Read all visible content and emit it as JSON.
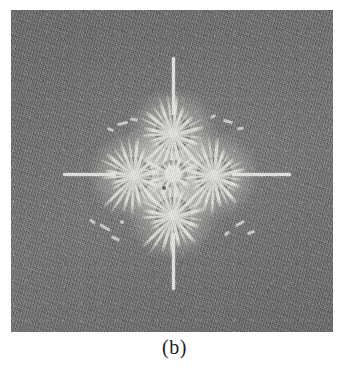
{
  "figure": {
    "caption": "(b)",
    "panel_label": "b",
    "background_color": "#737373",
    "deposit_color": "#e9e9e6",
    "electrode_dot_color": "#fcfcfa",
    "disc_color": "#7c7c7c",
    "panel": {
      "x": 11,
      "y": 10,
      "width": 322,
      "height": 322
    },
    "nodes": [
      {
        "name": "center-node",
        "cx": 162,
        "cy": 164,
        "dot_diameter": 16,
        "disc_diameter": 28
      },
      {
        "name": "top-node",
        "cx": 162,
        "cy": 123,
        "dot_diameter": 10,
        "disc_diameter": 36
      },
      {
        "name": "left-node",
        "cx": 123,
        "cy": 165,
        "dot_diameter": 10,
        "disc_diameter": 36
      },
      {
        "name": "right-node",
        "cx": 203,
        "cy": 165,
        "dot_diameter": 10,
        "disc_diameter": 36
      },
      {
        "name": "bottom-node",
        "cx": 162,
        "cy": 205,
        "dot_diameter": 10,
        "disc_diameter": 36
      }
    ],
    "rays": [
      {
        "name": "ray-up",
        "direction": "up",
        "length": 92
      },
      {
        "name": "ray-down",
        "direction": "down",
        "length": 72
      },
      {
        "name": "ray-left",
        "direction": "left",
        "length": 78
      },
      {
        "name": "ray-right",
        "direction": "right",
        "length": 78
      }
    ]
  }
}
